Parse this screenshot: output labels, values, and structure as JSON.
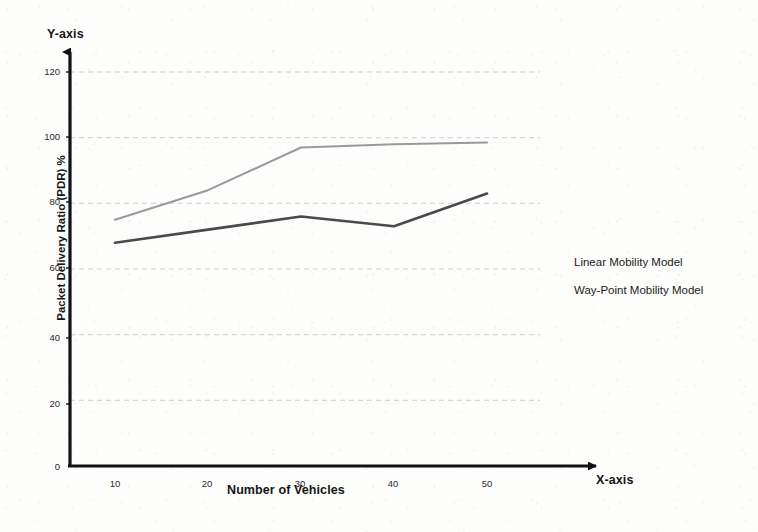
{
  "chart_data": {
    "type": "line",
    "title": "",
    "xlabel": "Number of Vehicles",
    "ylabel": "Packet Delivery Ratio (PDR) %",
    "x_axis_name": "X-axis",
    "y_axis_name": "Y-axis",
    "x": [
      10,
      20,
      30,
      40,
      50
    ],
    "xticklabels": [
      "10",
      "20",
      "30",
      "40",
      "50"
    ],
    "yticks": [
      0,
      20,
      40,
      60,
      80,
      100,
      120
    ],
    "yticklabels": [
      "0",
      "20",
      "40",
      "60",
      "80",
      "100",
      "120"
    ],
    "xlim": [
      5,
      55
    ],
    "ylim": [
      0,
      120
    ],
    "grid": "horizontal-dashed",
    "legend_position": "right",
    "series": [
      {
        "name": "Linear Mobility Model",
        "values": [
          68,
          72,
          76,
          73,
          83
        ],
        "color": "#4a4a4d",
        "width": 2.6
      },
      {
        "name": "Way-Point Mobility Model",
        "values": [
          75,
          84,
          97,
          98,
          98.5
        ],
        "color": "#9a9a9d",
        "width": 2.0
      }
    ]
  },
  "colors": {
    "axis": "#111214",
    "grid": "#c9c9cc",
    "plot_background": "#fdfdfc",
    "text": "#15161a"
  }
}
